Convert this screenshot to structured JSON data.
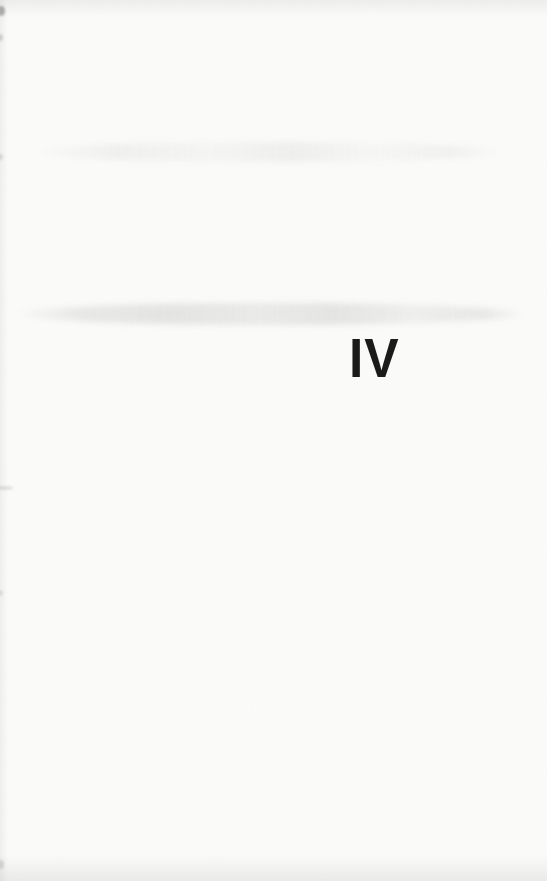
{
  "page": {
    "part_number": "IV"
  },
  "colors": {
    "paper": "#fcfcfb",
    "ink": "#1b1b1b"
  }
}
